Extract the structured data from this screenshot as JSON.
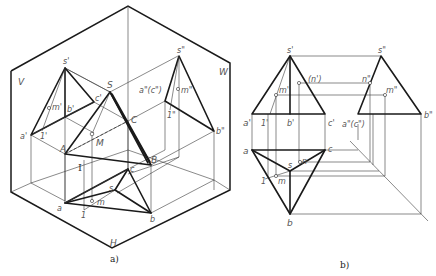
{
  "figure": {
    "caption_a": "a)",
    "caption_b": "b)"
  },
  "diagram_a": {
    "planes": {
      "V": "V",
      "W": "W",
      "H": "H"
    },
    "labels": {
      "s_prime": "s'",
      "m_prime": "m'",
      "b_prime": "b'",
      "c_prime": "c'",
      "a_prime": "a'",
      "one_prime": "1'",
      "S": "S",
      "C": "C",
      "M": "M",
      "A": "A",
      "B": "B",
      "roman_one": "I",
      "s_dprime": "s\"",
      "a_dprime_c": "a\"(c\")",
      "m_dprime": "m\"",
      "one_dprime": "1\"",
      "b_dprime": "b\"",
      "c": "c",
      "s": "s",
      "a": "a",
      "one": "1",
      "m": "m",
      "b": "b"
    }
  },
  "diagram_b": {
    "labels": {
      "s_prime": "s'",
      "n_prime_hidden": "(n')",
      "m_prime": "m'",
      "a_prime": "a'",
      "one_prime": "1'",
      "b_prime": "b'",
      "c_prime": "c'",
      "s_dprime": "s\"",
      "n_dprime": "n\"",
      "m_dprime": "m\"",
      "a_dprime_c": "a\"(c\")",
      "b_dprime": "b\"",
      "a": "a",
      "c": "c",
      "s": "s",
      "n": "n",
      "one": "1",
      "m": "m",
      "b": "b"
    }
  }
}
